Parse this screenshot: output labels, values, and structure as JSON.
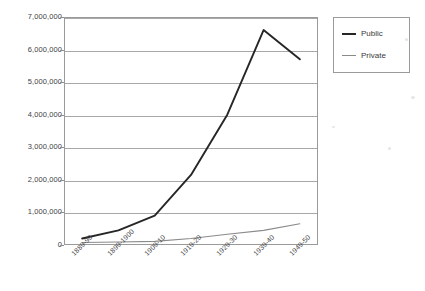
{
  "chart_data": {
    "type": "line",
    "title": "",
    "subtitle": "",
    "xlabel": "",
    "ylabel": "",
    "categories": [
      "1889-90",
      "1899-1900",
      "1909-10",
      "1919-20",
      "1929-30",
      "1939-40",
      "1949-50"
    ],
    "series": [
      {
        "name": "Public",
        "color": "#262626",
        "values": [
          200000,
          450000,
          900000,
          2150000,
          4000000,
          6600000,
          5700000
        ]
      },
      {
        "name": "Private",
        "color": "#8a8a8a",
        "values": [
          75000,
          90000,
          110000,
          200000,
          330000,
          450000,
          650000
        ]
      }
    ],
    "ylim": [
      0,
      7000000
    ],
    "ytick_values": [
      0,
      1000000,
      2000000,
      3000000,
      4000000,
      5000000,
      6000000,
      7000000
    ],
    "ytick_labels": [
      "0",
      "1,000,000",
      "2,000,000",
      "3,000,000",
      "4,000,000",
      "5,000,000",
      "6,000,000",
      "7,000,000"
    ],
    "grid": true,
    "grid_axis": "y",
    "legend_position": "right-top",
    "legend_entries": [
      "Public",
      "Private"
    ]
  }
}
